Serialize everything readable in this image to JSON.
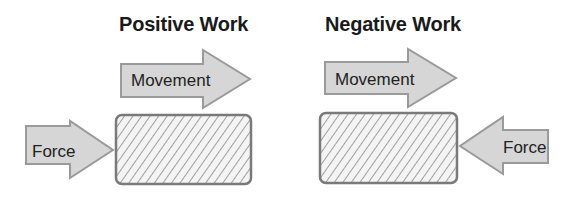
{
  "panels": [
    {
      "title": "Positive Work",
      "movement_label": "Movement",
      "force_label": "Force",
      "force_direction": "right",
      "movement_direction": "right"
    },
    {
      "title": "Negative Work",
      "movement_label": "Movement",
      "force_label": "Force",
      "force_direction": "left",
      "movement_direction": "right"
    }
  ],
  "colors": {
    "arrow_fill": "#d6d6d6",
    "arrow_stroke": "#9a9a9a",
    "box_stroke": "#7a7a7a",
    "hatch": "#8a8a8a",
    "text": "#1a1a1a"
  }
}
